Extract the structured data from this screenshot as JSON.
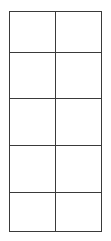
{
  "grid": {
    "rows": 5,
    "columns": 2,
    "line_color": "#3a3a3a",
    "background": "#ffffff",
    "cells": [
      [
        "",
        ""
      ],
      [
        "",
        ""
      ],
      [
        "",
        ""
      ],
      [
        "",
        ""
      ],
      [
        "",
        ""
      ]
    ]
  }
}
